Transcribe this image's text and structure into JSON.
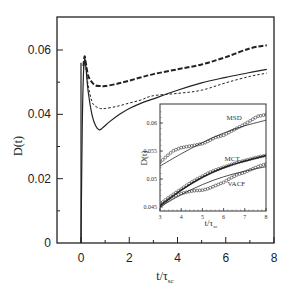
{
  "chart_data": [
    {
      "id": "main",
      "type": "line",
      "title": "",
      "xlabel": "t/τ_sc",
      "ylabel": "D(t)",
      "xlim": [
        -1,
        8
      ],
      "ylim": [
        0,
        0.07
      ],
      "xticks": [
        0,
        2,
        4,
        6,
        8
      ],
      "xtick_labels": [
        "0",
        "2",
        "4",
        "6",
        "8"
      ],
      "x_minor_ticks": [
        1,
        3,
        5,
        7
      ],
      "yticks": [
        0,
        0.02,
        0.04,
        0.06
      ],
      "ytick_labels": [
        "0",
        "0.02",
        "0.04",
        "0.06"
      ],
      "y_minor_ticks": [
        0.01,
        0.03,
        0.05
      ],
      "grid": false,
      "legend": null,
      "vertical_line_at_x": 0,
      "series": [
        {
          "name": "solid (MSD-derived)",
          "style": "solid",
          "x": [
            0,
            0.05,
            0.1,
            0.15,
            0.2,
            0.3,
            0.45,
            0.6,
            0.75,
            0.9,
            1.2,
            1.6,
            2,
            2.5,
            3,
            4,
            5,
            6,
            7,
            7.7
          ],
          "y": [
            0,
            0.035,
            0.052,
            0.057,
            0.055,
            0.047,
            0.04,
            0.0365,
            0.0352,
            0.0358,
            0.0378,
            0.04,
            0.0418,
            0.0435,
            0.0448,
            0.0475,
            0.0498,
            0.0515,
            0.053,
            0.054
          ]
        },
        {
          "name": "long-dashed (MCT)",
          "style": "long-dash",
          "x": [
            0.1,
            0.15,
            0.2,
            0.3,
            0.45,
            0.6,
            0.8,
            1,
            1.5,
            2,
            2.5,
            3,
            4,
            5,
            6,
            7,
            7.7
          ],
          "y": [
            0.055,
            0.058,
            0.056,
            0.052,
            0.05,
            0.049,
            0.0488,
            0.0488,
            0.0495,
            0.0505,
            0.0515,
            0.0525,
            0.054,
            0.0555,
            0.0578,
            0.0605,
            0.0615
          ]
        },
        {
          "name": "short-dashed (VACF)",
          "style": "short-dash",
          "x": [
            0.1,
            0.15,
            0.2,
            0.3,
            0.45,
            0.6,
            0.8,
            1,
            1.5,
            2,
            2.5,
            3,
            4,
            5,
            6,
            7,
            7.7
          ],
          "y": [
            0.054,
            0.057,
            0.055,
            0.049,
            0.044,
            0.0425,
            0.0418,
            0.0418,
            0.0425,
            0.0435,
            0.0445,
            0.0458,
            0.0465,
            0.0475,
            0.0498,
            0.0518,
            0.0528
          ]
        }
      ]
    },
    {
      "id": "inset",
      "type": "line",
      "title": "",
      "xlabel": "t/τ_sc",
      "ylabel": "D(t)",
      "xlim": [
        3,
        8
      ],
      "ylim": [
        0.0445,
        0.0622
      ],
      "xticks": [
        3,
        4,
        5,
        6,
        7,
        8
      ],
      "xtick_labels": [
        "3",
        "4",
        "5",
        "6",
        "7",
        "8"
      ],
      "yticks": [
        0.045,
        0.05,
        0.055,
        0.06
      ],
      "ytick_labels": [
        "0.045",
        "0.05",
        "0.055",
        "0.06"
      ],
      "grid": false,
      "annotations": [
        {
          "text": "MSD",
          "x": 6.5,
          "y": 0.0605
        },
        {
          "text": "MCT",
          "x": 6.4,
          "y": 0.0532
        },
        {
          "text": "VACF",
          "x": 6.6,
          "y": 0.0488
        }
      ],
      "series": [
        {
          "name": "MSD (symbols)",
          "style": "circles",
          "x": [
            3,
            3.3,
            3.6,
            4,
            4.3,
            4.6,
            5,
            5.3,
            5.6,
            6,
            6.3,
            6.6,
            7,
            7.3,
            7.6,
            8
          ],
          "y": [
            0.053,
            0.054,
            0.055,
            0.0556,
            0.0558,
            0.056,
            0.0563,
            0.0568,
            0.0574,
            0.0578,
            0.0584,
            0.059,
            0.0598,
            0.0605,
            0.0612,
            0.0615
          ]
        },
        {
          "name": "MSD (fit line)",
          "style": "solid",
          "x": [
            3,
            4,
            5,
            6,
            7,
            8
          ],
          "y": [
            0.0523,
            0.0545,
            0.0565,
            0.0582,
            0.0595,
            0.0605
          ]
        },
        {
          "name": "MCT (symbols)",
          "style": "circles",
          "x": [
            3,
            3.3,
            3.6,
            4,
            4.3,
            4.6,
            5,
            5.3,
            5.6,
            6,
            6.3,
            6.6,
            7,
            7.3,
            7.6,
            8
          ],
          "y": [
            0.0455,
            0.0464,
            0.0472,
            0.0482,
            0.049,
            0.0497,
            0.0505,
            0.0511,
            0.0516,
            0.0521,
            0.0525,
            0.0529,
            0.0533,
            0.0536,
            0.0539,
            0.0542
          ]
        },
        {
          "name": "MCT (line)",
          "style": "solid-thick",
          "x": [
            3,
            4,
            5,
            6,
            7,
            8
          ],
          "y": [
            0.0452,
            0.048,
            0.0503,
            0.052,
            0.0532,
            0.0542
          ]
        },
        {
          "name": "VACF (symbols)",
          "style": "circles",
          "x": [
            3,
            3.3,
            3.6,
            4,
            4.3,
            4.6,
            5,
            5.3,
            5.6,
            6,
            6.3,
            6.6,
            7,
            7.3,
            7.6,
            8
          ],
          "y": [
            0.0452,
            0.046,
            0.0468,
            0.0474,
            0.0477,
            0.0479,
            0.048,
            0.0483,
            0.0488,
            0.0494,
            0.0501,
            0.0507,
            0.0512,
            0.0517,
            0.0522,
            0.0527
          ]
        },
        {
          "name": "VACF (line)",
          "style": "solid",
          "x": [
            3,
            4,
            5,
            6,
            7,
            8
          ],
          "y": [
            0.045,
            0.0472,
            0.049,
            0.0504,
            0.0514,
            0.0522
          ]
        }
      ]
    }
  ],
  "labels": {
    "main_ylabel": "D(t)",
    "main_xlabel_base": "t/τ",
    "main_xlabel_sub": "sc",
    "inset_ylabel": "D(t)",
    "inset_xlabel_base": "t/τ",
    "inset_xlabel_sub": "sc"
  }
}
